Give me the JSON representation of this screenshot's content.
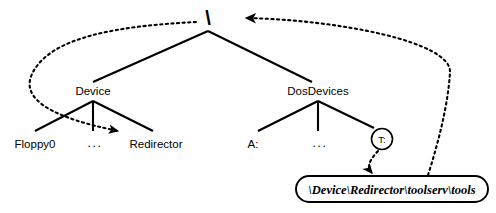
{
  "diagram": {
    "root": {
      "label": "\\",
      "name": "root-node"
    },
    "level1": [
      {
        "label": "Device",
        "name": "device-node"
      },
      {
        "label": "DosDevices",
        "name": "dosdevices-node"
      }
    ],
    "device_children": [
      {
        "label": "Floppy0",
        "name": "floppy0-node"
      },
      {
        "label": "...",
        "name": "device-ellipsis"
      },
      {
        "label": "Redirector",
        "name": "redirector-node"
      }
    ],
    "dosdevices_children": [
      {
        "label": "A:",
        "name": "drive-a-node"
      },
      {
        "label": "...",
        "name": "dosdevices-ellipsis"
      },
      {
        "label": "T:",
        "name": "drive-t-node"
      }
    ],
    "symlink_target": {
      "label": "\\Device\\Redirector\\toolserv\\tools",
      "name": "symlink-target-box"
    },
    "colors": {
      "line": "#000000",
      "background": "#ffffff",
      "text": "#000000"
    },
    "edges": {
      "solid_style": "solid",
      "link_style": "dotted-with-arrowhead"
    }
  }
}
